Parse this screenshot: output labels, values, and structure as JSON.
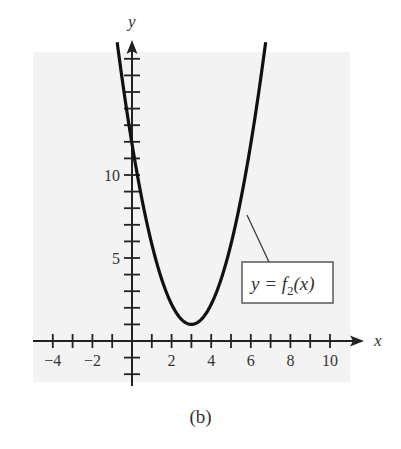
{
  "figure": {
    "caption": "(b)",
    "background_color": "#f3f3f3",
    "curve_color": "#111111",
    "axis_color": "#222222"
  },
  "chart_data": {
    "type": "line",
    "title": "",
    "xlabel": "x",
    "ylabel": "y",
    "xlim": [
      -5,
      11
    ],
    "ylim": [
      -2.5,
      18
    ],
    "grid": false,
    "x_ticks": [
      -4,
      -3,
      -2,
      -1,
      1,
      2,
      3,
      4,
      5,
      6,
      7,
      8,
      9,
      10
    ],
    "x_tick_labels": [
      "-4",
      "-2",
      "2",
      "4",
      "6",
      "8",
      "10"
    ],
    "x_tick_label_values": [
      -4,
      -2,
      2,
      4,
      6,
      8,
      10
    ],
    "y_ticks": [
      -2,
      -1,
      1,
      2,
      3,
      4,
      5,
      6,
      7,
      8,
      9,
      10,
      11,
      12,
      13,
      14,
      15,
      16,
      17
    ],
    "y_tick_labels": [
      "5",
      "10"
    ],
    "y_tick_label_values": [
      5,
      10
    ],
    "series": [
      {
        "name": "y = f2(x)",
        "description": "Upward-opening parabola with vertex near (3, 1)",
        "x": [
          -0.75,
          0,
          1,
          2,
          3,
          4,
          5,
          6,
          6.75
        ],
        "y": [
          18,
          9.5,
          5,
          2,
          1,
          2,
          5,
          10,
          18
        ]
      }
    ],
    "annotations": [
      {
        "text": "y = f₂(x)",
        "points_to": [
          5.8,
          8
        ],
        "box": true
      }
    ]
  },
  "labels": {
    "x_axis": "x",
    "y_axis": "y",
    "curve_label_y": "y = ",
    "curve_label_f": "f",
    "curve_label_sub": "2",
    "curve_label_arg": "(x)"
  }
}
